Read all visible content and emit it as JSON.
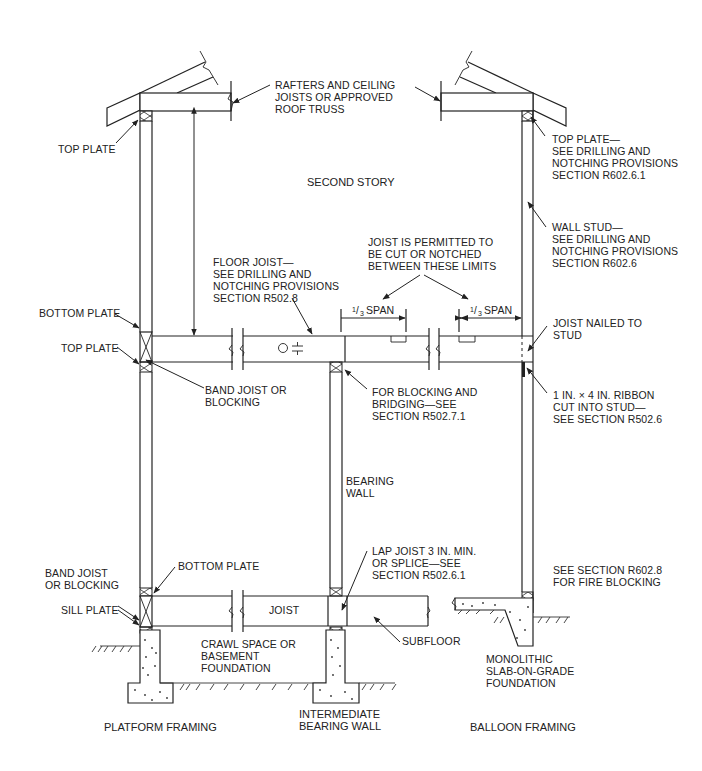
{
  "diagram": {
    "section_titles": {
      "platform": "PLATFORM FRAMING",
      "intermediate_line1": "INTERMEDIATE",
      "intermediate_line2": "BEARING WALL",
      "balloon": "BALLOON FRAMING",
      "second_story": "SECOND STORY"
    },
    "labels": {
      "rafters": [
        "RAFTERS AND CEILING",
        "JOISTS OR APPROVED",
        "ROOF TRUSS"
      ],
      "top_plate_left": [
        "TOP PLATE"
      ],
      "top_plate_right": [
        "TOP PLATE—",
        "SEE DRILLING AND",
        "NOTCHING PROVISIONS",
        "SECTION R602.6.1"
      ],
      "wall_stud": [
        "WALL STUD—",
        "SEE DRILLING AND",
        "NOTCHING PROVISIONS",
        "SECTION R602.6"
      ],
      "joist_permitted": [
        "JOIST IS PERMITTED TO",
        "BE CUT OR NOTCHED",
        "BETWEEN THESE LIMITS"
      ],
      "floor_joist": [
        "FLOOR JOIST—",
        "SEE DRILLING AND",
        "NOTCHING PROVISIONS",
        "SECTION R502.8"
      ],
      "span_left": {
        "frac_num": "1",
        "frac_den": "3",
        "text": "SPAN"
      },
      "span_right": {
        "frac_num": "1",
        "frac_den": "3",
        "text": "SPAN"
      },
      "bottom_plate_upper": [
        "BOTTOM PLATE"
      ],
      "top_plate_mid": [
        "TOP PLATE"
      ],
      "band_joist_upper": [
        "BAND JOIST OR",
        "BLOCKING"
      ],
      "joist_nailed": [
        "JOIST NAILED TO",
        "STUD"
      ],
      "blocking_bridging": [
        "FOR BLOCKING AND",
        "BRIDGING—SEE",
        "SECTION R502.7.1"
      ],
      "ribbon": [
        "1 IN. × 4 IN. RIBBON",
        "CUT INTO STUD—",
        "SEE SECTION R502.6"
      ],
      "bearing_wall": [
        "BEARING",
        "WALL"
      ],
      "band_joist_lower": [
        "BAND JOIST",
        "OR BLOCKING"
      ],
      "bottom_plate_lower": [
        "BOTTOM PLATE"
      ],
      "lap_joist": [
        "LAP JOIST 3 IN. MIN.",
        "OR SPLICE—SEE",
        "SECTION R502.6.1"
      ],
      "fire_blocking": [
        "SEE SECTION R602.8",
        "FOR FIRE BLOCKING"
      ],
      "sill_plate": [
        "SILL PLATE"
      ],
      "joist": [
        "JOIST"
      ],
      "crawl_space": [
        "CRAWL SPACE OR",
        "BASEMENT",
        "FOUNDATION"
      ],
      "subfloor": [
        "SUBFLOOR"
      ],
      "monolithic": [
        "MONOLITHIC",
        "SLAB-ON-GRADE",
        "FOUNDATION"
      ]
    },
    "colors": {
      "line": "#222222",
      "background": "#ffffff"
    }
  }
}
